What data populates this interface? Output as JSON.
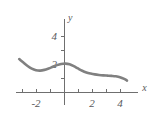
{
  "figure": {
    "background_color": "#ffffff",
    "axis_color": "#6f6f6f",
    "curve_color": "#808080",
    "label_color": "#58585a"
  },
  "axis_names": {
    "x": "x",
    "y": "y"
  },
  "chart_data": {
    "type": "line",
    "title": "",
    "subtitle": "",
    "xlabel": "x",
    "ylabel": "y",
    "xlim": [
      -3.4,
      5.3
    ],
    "ylim": [
      -0.9,
      5.2
    ],
    "grid": false,
    "legend": null,
    "x_ticks": [
      -3,
      -2,
      -1,
      0,
      1,
      2,
      3,
      4
    ],
    "x_tick_labels": [
      "",
      "-2",
      "",
      "",
      "",
      "2",
      "",
      "4"
    ],
    "y_ticks": [
      1,
      2,
      3,
      4
    ],
    "y_tick_labels": [
      "",
      "2",
      "",
      "4"
    ],
    "series": [
      {
        "name": "curve",
        "color": "#808080",
        "x": [
          -3.2,
          -2.9,
          -2.6,
          -2.3,
          -2.0,
          -1.7,
          -1.4,
          -1.1,
          -0.8,
          -0.5,
          -0.2,
          0.1,
          0.4,
          0.7,
          1.0,
          1.3,
          1.6,
          1.9,
          2.2,
          2.5,
          2.8,
          3.1,
          3.4,
          3.7,
          4.0,
          4.3,
          4.5
        ],
        "y": [
          2.35,
          2.1,
          1.86,
          1.67,
          1.56,
          1.53,
          1.58,
          1.68,
          1.8,
          1.92,
          2.0,
          2.03,
          1.98,
          1.85,
          1.68,
          1.52,
          1.4,
          1.32,
          1.26,
          1.22,
          1.19,
          1.17,
          1.15,
          1.12,
          1.06,
          0.94,
          0.82
        ]
      }
    ]
  }
}
